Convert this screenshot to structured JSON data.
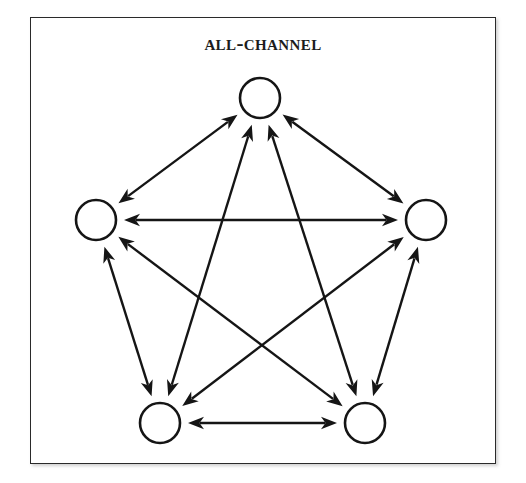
{
  "figure": {
    "title": "All-Channel",
    "frame": {
      "border_color": "#2a2a2a",
      "background_color": "#ffffff"
    },
    "ink_color": "#151515"
  },
  "chart_data": {
    "type": "diagram",
    "diagram_kind": "network-graph",
    "title": "All-Channel",
    "node_count": 5,
    "edge_count": 10,
    "edge_style": "double-headed arrow",
    "directed": "bidirectional",
    "nodes": [
      {
        "id": "top",
        "label": "",
        "x": 260,
        "y": 98,
        "r": 20
      },
      {
        "id": "left",
        "label": "",
        "x": 96,
        "y": 220,
        "r": 20
      },
      {
        "id": "right",
        "label": "",
        "x": 426,
        "y": 220,
        "r": 20
      },
      {
        "id": "bottom-left",
        "label": "",
        "x": 160,
        "y": 423,
        "r": 20
      },
      {
        "id": "bottom-right",
        "label": "",
        "x": 365,
        "y": 423,
        "r": 20
      }
    ],
    "edges": [
      {
        "from": "top",
        "to": "left",
        "bidirectional": true
      },
      {
        "from": "top",
        "to": "right",
        "bidirectional": true
      },
      {
        "from": "top",
        "to": "bottom-left",
        "bidirectional": true
      },
      {
        "from": "top",
        "to": "bottom-right",
        "bidirectional": true
      },
      {
        "from": "left",
        "to": "right",
        "bidirectional": true
      },
      {
        "from": "left",
        "to": "bottom-left",
        "bidirectional": true
      },
      {
        "from": "left",
        "to": "bottom-right",
        "bidirectional": true
      },
      {
        "from": "right",
        "to": "bottom-left",
        "bidirectional": true
      },
      {
        "from": "right",
        "to": "bottom-right",
        "bidirectional": true
      },
      {
        "from": "bottom-left",
        "to": "bottom-right",
        "bidirectional": true
      }
    ],
    "xlabel": "",
    "ylabel": "",
    "legend": [],
    "grid": false
  }
}
